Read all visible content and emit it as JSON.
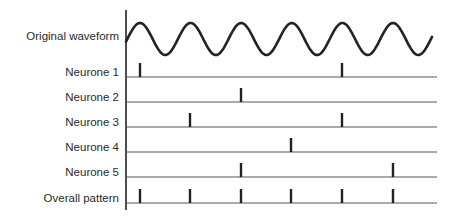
{
  "diagram": {
    "type": "volley-principle-spike-raster",
    "axis": {
      "x": 126,
      "y_top": 10,
      "y_bottom": 210,
      "color": "#222222"
    },
    "baseline_end_x": 437,
    "colors": {
      "line": "#555555",
      "spike": "#222222",
      "waveform": "#222222",
      "text": "#2a2a2a"
    },
    "waveform": {
      "label": "Original waveform",
      "label_y": 40,
      "x_start": 126,
      "x_end": 432,
      "mid_y": 39,
      "amplitude": 16,
      "period": 50.6,
      "first_peak_x": 140
    },
    "rows": [
      {
        "label": "Neurone 1",
        "baseline_y": 77,
        "spikes_x": [
          140,
          342
        ]
      },
      {
        "label": "Neurone 2",
        "baseline_y": 102,
        "spikes_x": [
          241
        ]
      },
      {
        "label": "Neurone 3",
        "baseline_y": 127,
        "spikes_x": [
          190,
          342
        ]
      },
      {
        "label": "Neurone 4",
        "baseline_y": 152,
        "spikes_x": [
          291
        ]
      },
      {
        "label": "Neurone 5",
        "baseline_y": 177,
        "spikes_x": [
          241,
          393
        ]
      },
      {
        "label": "Overall pattern",
        "baseline_y": 203,
        "spikes_x": [
          140,
          190,
          241,
          291,
          342,
          393
        ]
      }
    ],
    "spike_height": 14,
    "spike_width": 2.4,
    "label_right_x": 119
  }
}
